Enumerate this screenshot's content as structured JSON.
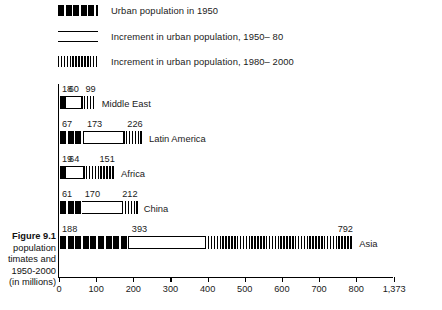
{
  "figure": {
    "number": "Figure 9.1",
    "caption_lines": [
      "population",
      "timates and",
      "1950-2000",
      "(in millions)"
    ],
    "units_note": "(in millions)"
  },
  "legend": {
    "items": [
      {
        "label": "Urban population in 1950",
        "pattern": "solid-black-bars",
        "color": "#000000"
      },
      {
        "label": "Increment in urban population, 1950– 80",
        "pattern": "open-horizontal-rules",
        "color": "#000000"
      },
      {
        "label": "Increment in urban population, 1980– 2000",
        "pattern": "fine-vertical-hatch",
        "color": "#000000"
      }
    ]
  },
  "chart_data": {
    "type": "bar",
    "orientation": "horizontal",
    "stacked": true,
    "title": "Figure 9.1 population timates and 1950-2000 (in millions)",
    "xlabel": "",
    "ylabel": "",
    "xlim": [
      0,
      800
    ],
    "grid": false,
    "legend_position": "top",
    "axis_break": {
      "present": true,
      "after_value": 800,
      "final_tick_label": "1,373"
    },
    "tick_labels": [
      "0",
      "100",
      "200",
      "300",
      "400",
      "500",
      "600",
      "700",
      "800",
      "1,373"
    ],
    "tick_values": [
      0,
      100,
      200,
      300,
      400,
      500,
      600,
      700,
      800,
      1373
    ],
    "categories": [
      "Middle East",
      "Latin America",
      "Africa",
      "China",
      "Asia"
    ],
    "series": [
      {
        "name": "Urban population in 1950",
        "values": [
          18,
          67,
          19,
          61,
          188
        ]
      },
      {
        "name": "Increment in urban population, 1950– 80",
        "values": [
          60,
          173,
          64,
          170,
          393
        ]
      },
      {
        "name": "Increment in urban population, 1980– 2000",
        "values": [
          99,
          226,
          151,
          212,
          792
        ]
      }
    ],
    "rows": [
      {
        "region": "Middle East",
        "v1950": "18",
        "v1980": "60",
        "v2000": "99"
      },
      {
        "region": "Latin America",
        "v1950": "67",
        "v1980": "173",
        "v2000": "226"
      },
      {
        "region": "Africa",
        "v1950": "19",
        "v1980": "64",
        "v2000": "151"
      },
      {
        "region": "China",
        "v1950": "61",
        "v1980": "170",
        "v2000": "212"
      },
      {
        "region": "Asia",
        "v1950": "188",
        "v1980": "393",
        "v2000": "792"
      }
    ]
  }
}
